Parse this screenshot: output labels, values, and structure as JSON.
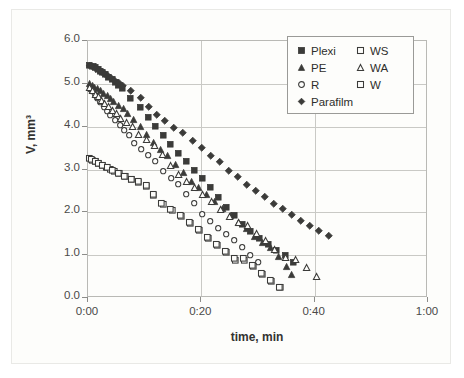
{
  "figure": {
    "background": "#fdfdfb",
    "frame_color": "#b9b9b5",
    "grid_color": "#c9c9c5",
    "marker_color": "#3b3b39"
  },
  "axes": {
    "ylabel": "V, mm³",
    "xlabel": "time, min",
    "ytick_labels": [
      "0.0",
      "1.0",
      "2.0",
      "3.0",
      "4.0",
      "5.0",
      "6.0"
    ],
    "xtick_labels": [
      "0:00",
      "0:20",
      "0:40",
      "1:00"
    ]
  },
  "legend": {
    "rows": [
      [
        {
          "label": "Plexi",
          "marker": "filled-square-icon"
        },
        {
          "label": "WS",
          "marker": "open-square-icon"
        }
      ],
      [
        {
          "label": "PE",
          "marker": "filled-triangle-icon"
        },
        {
          "label": "WA",
          "marker": "open-triangle-icon"
        }
      ],
      [
        {
          "label": "R",
          "marker": "open-circle-icon"
        },
        {
          "label": "W",
          "marker": "open-square-icon"
        }
      ],
      [
        {
          "label": "Parafilm",
          "marker": "filled-diamond-icon"
        }
      ]
    ]
  },
  "chart_data": {
    "type": "scatter",
    "title": "",
    "xlabel": "time, min",
    "ylabel": "V, mm³",
    "xlim": [
      0,
      60
    ],
    "ylim": [
      0,
      6
    ],
    "xticks": [
      0,
      20,
      40,
      60
    ],
    "xtick_labels": [
      "0:00",
      "0:20",
      "0:40",
      "1:00"
    ],
    "yticks": [
      0,
      1,
      2,
      3,
      4,
      5,
      6
    ],
    "ytick_labels": [
      "0.0",
      "1.0",
      "2.0",
      "3.0",
      "4.0",
      "5.0",
      "6.0"
    ],
    "grid": true,
    "legend_position": "top-right",
    "series": [
      {
        "name": "Plexi",
        "marker": "filled-square",
        "filled": true,
        "color": "#3b3b39",
        "points": [
          [
            0.3,
            5.44
          ],
          [
            0.9,
            5.42
          ],
          [
            1.3,
            5.38
          ],
          [
            1.8,
            5.34
          ],
          [
            2.2,
            5.3
          ],
          [
            2.6,
            5.27
          ],
          [
            3.1,
            5.22
          ],
          [
            3.6,
            5.16
          ],
          [
            4.2,
            5.1
          ],
          [
            4.8,
            5.04
          ],
          [
            5.4,
            4.97
          ],
          [
            6.0,
            4.9
          ],
          [
            7.4,
            4.67
          ],
          [
            9.2,
            4.45
          ],
          [
            10.6,
            4.23
          ],
          [
            11.8,
            4.0
          ],
          [
            13.2,
            3.79
          ],
          [
            14.6,
            3.6
          ],
          [
            16.0,
            3.37
          ],
          [
            17.4,
            3.2
          ],
          [
            18.8,
            2.98
          ],
          [
            20.2,
            2.79
          ],
          [
            21.6,
            2.59
          ],
          [
            23.0,
            2.36
          ],
          [
            24.4,
            2.12
          ],
          [
            25.8,
            1.93
          ],
          [
            27.2,
            1.72
          ],
          [
            28.6,
            1.56
          ],
          [
            30.3,
            1.39
          ],
          [
            31.8,
            1.25
          ],
          [
            33.3,
            1.11
          ],
          [
            34.8,
            0.99
          ],
          [
            36.3,
            0.84
          ]
        ]
      },
      {
        "name": "PE",
        "marker": "filled-triangle",
        "filled": true,
        "color": "#3b3b39",
        "points": [
          [
            0.3,
            5.0
          ],
          [
            0.8,
            4.96
          ],
          [
            1.2,
            4.92
          ],
          [
            1.7,
            4.88
          ],
          [
            2.2,
            4.84
          ],
          [
            2.8,
            4.78
          ],
          [
            3.4,
            4.72
          ],
          [
            4.0,
            4.66
          ],
          [
            4.6,
            4.58
          ],
          [
            5.4,
            4.5
          ],
          [
            6.2,
            4.42
          ],
          [
            7.0,
            4.3
          ],
          [
            8.0,
            4.16
          ],
          [
            9.2,
            4.0
          ],
          [
            10.4,
            3.82
          ],
          [
            11.6,
            3.62
          ],
          [
            12.8,
            3.46
          ],
          [
            14.0,
            3.32
          ],
          [
            15.4,
            3.12
          ],
          [
            16.8,
            2.92
          ],
          [
            18.2,
            2.72
          ],
          [
            19.6,
            2.58
          ],
          [
            21.0,
            2.42
          ],
          [
            22.4,
            2.25
          ],
          [
            23.8,
            2.08
          ],
          [
            25.2,
            1.92
          ],
          [
            26.6,
            1.76
          ],
          [
            28.0,
            1.62
          ],
          [
            29.4,
            1.44
          ],
          [
            30.8,
            1.3
          ],
          [
            32.2,
            1.18
          ],
          [
            33.6,
            0.96
          ],
          [
            35.0,
            0.73
          ],
          [
            36.0,
            0.54
          ]
        ]
      },
      {
        "name": "R",
        "marker": "open-circle",
        "filled": false,
        "color": "#3b3b39",
        "points": [
          [
            0.3,
            4.88
          ],
          [
            0.8,
            4.82
          ],
          [
            1.2,
            4.74
          ],
          [
            1.7,
            4.66
          ],
          [
            2.2,
            4.56
          ],
          [
            2.8,
            4.46
          ],
          [
            3.4,
            4.36
          ],
          [
            4.0,
            4.26
          ],
          [
            4.8,
            4.16
          ],
          [
            5.6,
            4.04
          ],
          [
            6.4,
            3.92
          ],
          [
            7.2,
            3.8
          ],
          [
            8.2,
            3.62
          ],
          [
            9.4,
            3.48
          ],
          [
            10.6,
            3.33
          ],
          [
            11.8,
            3.19
          ],
          [
            13.2,
            2.95
          ],
          [
            14.6,
            2.8
          ],
          [
            16.0,
            2.66
          ],
          [
            17.4,
            2.42
          ],
          [
            18.8,
            2.22
          ],
          [
            20.2,
            1.95
          ],
          [
            21.6,
            1.8
          ],
          [
            23.0,
            1.64
          ],
          [
            24.4,
            1.49
          ],
          [
            25.8,
            1.36
          ],
          [
            27.2,
            1.18
          ],
          [
            28.6,
            1.0
          ],
          [
            30.0,
            0.84
          ]
        ]
      },
      {
        "name": "Parafilm",
        "marker": "filled-diamond",
        "filled": true,
        "color": "#3b3b39",
        "points": [
          [
            0.3,
            5.42
          ],
          [
            0.9,
            5.4
          ],
          [
            1.4,
            5.36
          ],
          [
            1.9,
            5.32
          ],
          [
            2.4,
            5.28
          ],
          [
            2.9,
            5.24
          ],
          [
            3.5,
            5.2
          ],
          [
            4.1,
            5.14
          ],
          [
            4.8,
            5.08
          ],
          [
            5.5,
            5.02
          ],
          [
            6.2,
            4.96
          ],
          [
            7.6,
            4.84
          ],
          [
            9.3,
            4.68
          ],
          [
            10.8,
            4.46
          ],
          [
            12.2,
            4.27
          ],
          [
            13.6,
            4.14
          ],
          [
            15.2,
            3.98
          ],
          [
            16.8,
            3.85
          ],
          [
            18.4,
            3.66
          ],
          [
            20.0,
            3.5
          ],
          [
            21.6,
            3.33
          ],
          [
            23.2,
            3.18
          ],
          [
            24.8,
            2.98
          ],
          [
            26.4,
            2.82
          ],
          [
            28.0,
            2.65
          ],
          [
            29.6,
            2.51
          ],
          [
            31.2,
            2.36
          ],
          [
            32.8,
            2.21
          ],
          [
            34.4,
            2.08
          ],
          [
            36.0,
            1.94
          ],
          [
            37.6,
            1.81
          ],
          [
            39.2,
            1.69
          ],
          [
            40.8,
            1.58
          ],
          [
            42.4,
            1.46
          ]
        ]
      },
      {
        "name": "WA",
        "marker": "open-triangle",
        "filled": false,
        "color": "#3b3b39",
        "points": [
          [
            0.3,
            4.92
          ],
          [
            0.8,
            4.84
          ],
          [
            1.3,
            4.76
          ],
          [
            1.8,
            4.7
          ],
          [
            2.4,
            4.62
          ],
          [
            3.0,
            4.54
          ],
          [
            3.6,
            4.46
          ],
          [
            4.3,
            4.38
          ],
          [
            5.0,
            4.3
          ],
          [
            5.8,
            4.2
          ],
          [
            6.8,
            4.1
          ],
          [
            7.8,
            4.0
          ],
          [
            9.0,
            3.82
          ],
          [
            10.4,
            3.7
          ],
          [
            11.8,
            3.56
          ],
          [
            13.2,
            3.34
          ],
          [
            14.6,
            3.1
          ],
          [
            16.0,
            2.88
          ],
          [
            17.4,
            2.72
          ],
          [
            18.8,
            2.58
          ],
          [
            20.2,
            2.42
          ],
          [
            21.8,
            2.26
          ],
          [
            23.4,
            2.06
          ],
          [
            25.0,
            1.9
          ],
          [
            26.6,
            1.76
          ],
          [
            28.2,
            1.7
          ],
          [
            29.8,
            1.5
          ],
          [
            31.4,
            1.34
          ],
          [
            33.0,
            1.14
          ],
          [
            34.8,
            0.94
          ],
          [
            36.6,
            0.9
          ],
          [
            38.6,
            0.7
          ],
          [
            40.4,
            0.5
          ]
        ]
      },
      {
        "name": "WS",
        "marker": "open-square",
        "filled": false,
        "color": "#3b3b39",
        "points": [
          [
            0.3,
            3.25
          ],
          [
            0.8,
            3.22
          ],
          [
            1.3,
            3.18
          ],
          [
            1.9,
            3.14
          ],
          [
            2.5,
            3.1
          ],
          [
            3.2,
            3.06
          ],
          [
            3.9,
            3.0
          ],
          [
            4.7,
            2.96
          ],
          [
            5.6,
            2.9
          ],
          [
            6.6,
            2.83
          ],
          [
            7.6,
            2.76
          ],
          [
            8.8,
            2.7
          ],
          [
            10.2,
            2.61
          ],
          [
            11.6,
            2.39
          ],
          [
            13.2,
            2.19
          ],
          [
            14.8,
            2.04
          ],
          [
            16.4,
            1.9
          ],
          [
            18.0,
            1.74
          ],
          [
            19.6,
            1.57
          ],
          [
            21.2,
            1.39
          ],
          [
            22.8,
            1.23
          ],
          [
            24.4,
            1.06
          ],
          [
            26.0,
            0.89
          ],
          [
            27.6,
            0.89
          ],
          [
            29.2,
            0.74
          ],
          [
            30.8,
            0.56
          ],
          [
            32.4,
            0.39
          ],
          [
            34.0,
            0.24
          ]
        ]
      },
      {
        "name": "W",
        "marker": "open-square",
        "filled": false,
        "color": "#3b3b39",
        "points": [
          [
            0.5,
            3.23
          ],
          [
            1.2,
            3.2
          ],
          [
            1.9,
            3.15
          ],
          [
            2.6,
            3.1
          ],
          [
            3.4,
            3.04
          ],
          [
            4.3,
            2.98
          ],
          [
            5.3,
            2.92
          ],
          [
            6.4,
            2.85
          ],
          [
            7.6,
            2.78
          ],
          [
            8.9,
            2.72
          ],
          [
            10.2,
            2.63
          ],
          [
            11.6,
            2.43
          ],
          [
            13.0,
            2.22
          ],
          [
            14.6,
            2.06
          ],
          [
            16.2,
            1.92
          ],
          [
            17.8,
            1.76
          ],
          [
            19.4,
            1.6
          ],
          [
            21.0,
            1.42
          ],
          [
            22.6,
            1.26
          ],
          [
            24.2,
            1.09
          ],
          [
            25.8,
            0.92
          ],
          [
            27.4,
            0.92
          ],
          [
            29.0,
            0.77
          ],
          [
            30.6,
            0.58
          ],
          [
            32.2,
            0.42
          ],
          [
            33.8,
            0.26
          ]
        ]
      }
    ]
  }
}
